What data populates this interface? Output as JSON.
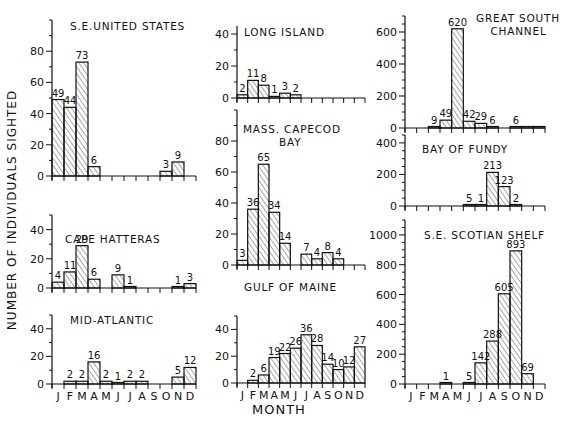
{
  "figure": {
    "ylabel": "NUMBER OF INDIVIDUALS SIGHTED",
    "xlabel": "MONTH",
    "months": [
      "J",
      "F",
      "M",
      "A",
      "M",
      "J",
      "J",
      "A",
      "S",
      "O",
      "N",
      "D"
    ]
  },
  "chart_data": [
    {
      "type": "bar",
      "title": "S.E. UNITED STATES",
      "categories": [
        "J",
        "F",
        "M",
        "A",
        "M",
        "J",
        "J",
        "A",
        "S",
        "O",
        "N",
        "D"
      ],
      "values": [
        49,
        44,
        73,
        6,
        null,
        null,
        null,
        null,
        null,
        3,
        9,
        null
      ],
      "yticks": [
        0,
        20,
        40,
        60,
        80
      ],
      "ylim": [
        0,
        100
      ],
      "xlabel": "",
      "ylabel": "Number of individuals sighted"
    },
    {
      "type": "bar",
      "title": "CAPE HATTERAS",
      "categories": [
        "J",
        "F",
        "M",
        "A",
        "M",
        "J",
        "J",
        "A",
        "S",
        "O",
        "N",
        "D"
      ],
      "values": [
        4,
        11,
        29,
        6,
        null,
        9,
        1,
        null,
        null,
        null,
        1,
        3
      ],
      "yticks": [
        0,
        20,
        40
      ],
      "ylim": [
        0,
        50
      ]
    },
    {
      "type": "bar",
      "title": "MID-ATLANTIC",
      "categories": [
        "J",
        "F",
        "M",
        "A",
        "M",
        "J",
        "J",
        "A",
        "S",
        "O",
        "N",
        "D"
      ],
      "values": [
        null,
        2,
        2,
        16,
        2,
        1,
        2,
        2,
        null,
        null,
        5,
        12
      ],
      "yticks": [
        0,
        20,
        40
      ],
      "ylim": [
        0,
        50
      ]
    },
    {
      "type": "bar",
      "title": "LONG ISLAND",
      "categories": [
        "J",
        "F",
        "M",
        "A",
        "M",
        "J",
        "J",
        "A",
        "S",
        "O",
        "N",
        "D"
      ],
      "values": [
        2,
        11,
        8,
        1,
        3,
        2,
        null,
        null,
        null,
        null,
        null,
        null
      ],
      "yticks": [
        0,
        20,
        40
      ],
      "ylim": [
        0,
        45
      ]
    },
    {
      "type": "bar",
      "title": "MASS. CAPECOD BAY",
      "categories": [
        "J",
        "F",
        "M",
        "A",
        "M",
        "J",
        "J",
        "A",
        "S",
        "O",
        "N",
        "D"
      ],
      "values": [
        3,
        36,
        65,
        34,
        14,
        null,
        7,
        4,
        8,
        4,
        null,
        null
      ],
      "yticks": [
        0,
        20,
        40,
        60,
        80
      ],
      "ylim": [
        0,
        100
      ]
    },
    {
      "type": "bar",
      "title": "GULF OF MAINE",
      "categories": [
        "J",
        "F",
        "M",
        "A",
        "M",
        "J",
        "J",
        "A",
        "S",
        "O",
        "N",
        "D"
      ],
      "values": [
        null,
        2,
        6,
        19,
        22,
        26,
        36,
        28,
        14,
        10,
        12,
        27
      ],
      "yticks": [
        0,
        20,
        40
      ],
      "ylim": [
        0,
        50
      ]
    },
    {
      "type": "bar",
      "title": "GREAT SOUTH CHANNEL",
      "categories": [
        "J",
        "F",
        "M",
        "A",
        "M",
        "J",
        "J",
        "A",
        "S",
        "O",
        "N",
        "D"
      ],
      "values": [
        null,
        null,
        9,
        49,
        620,
        42,
        29,
        6,
        null,
        6,
        0,
        0
      ],
      "yticks": [
        0,
        200,
        400,
        600
      ],
      "ylim": [
        0,
        700
      ]
    },
    {
      "type": "bar",
      "title": "BAY OF FUNDY",
      "categories": [
        "J",
        "F",
        "M",
        "A",
        "M",
        "J",
        "J",
        "A",
        "S",
        "O",
        "N",
        "D"
      ],
      "values": [
        null,
        null,
        null,
        null,
        null,
        5,
        1,
        213,
        123,
        2,
        null,
        null
      ],
      "yticks": [
        0,
        200,
        400
      ],
      "ylim": [
        0,
        450
      ]
    },
    {
      "type": "bar",
      "title": "S.E. SCOTIAN SHELF",
      "categories": [
        "J",
        "F",
        "M",
        "A",
        "M",
        "J",
        "J",
        "A",
        "S",
        "O",
        "N",
        "D"
      ],
      "values": [
        null,
        null,
        null,
        1,
        null,
        5,
        142,
        288,
        605,
        893,
        69,
        null
      ],
      "yticks": [
        0,
        200,
        400,
        600,
        800,
        1000
      ],
      "ylim": [
        0,
        1100
      ]
    }
  ],
  "panels": [
    {
      "title_lines": [
        "S.E.UNITED STATES"
      ],
      "label_x": 0
    },
    {
      "title_lines": [
        "CAPE HATTERAS"
      ],
      "label_x": 0
    },
    {
      "title_lines": [
        "MID-ATLANTIC"
      ],
      "label_x": 0
    },
    {
      "title_lines": [
        "LONG ISLAND"
      ],
      "label_x": 0
    },
    {
      "title_lines": [
        "MASS. CAPECOD",
        "BAY"
      ],
      "label_x": 0
    },
    {
      "title_lines": [
        "GULF OF MAINE"
      ],
      "label_x": 0
    },
    {
      "title_lines": [
        "GREAT SOUTH",
        "CHANNEL"
      ],
      "label_x": 0
    },
    {
      "title_lines": [
        "BAY OF FUNDY"
      ],
      "label_x": 0
    },
    {
      "title_lines": [
        "S.E. SCOTIAN SHELF"
      ],
      "label_x": 0
    }
  ]
}
